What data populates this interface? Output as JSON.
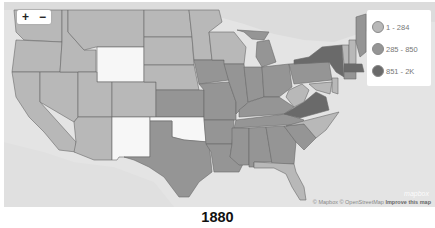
{
  "map": {
    "title": "1880",
    "zoom_in_label": "+",
    "zoom_out_label": "−",
    "legend": [
      {
        "label": "1 - 284",
        "color": "#b8b8b8"
      },
      {
        "label": "285 - 850",
        "color": "#959595"
      },
      {
        "label": "851 - 2K",
        "color": "#6a6a6a"
      }
    ],
    "no_data_color": "#f7f7f7",
    "water_color": "#e4e4e4",
    "attribution": {
      "mapbox": "© Mapbox",
      "osm": "© OpenStreetMap",
      "improve": "Improve this map"
    },
    "logo": "mapbox",
    "states": [
      {
        "name": "Washington",
        "bin": "1 - 284"
      },
      {
        "name": "Oregon",
        "bin": "1 - 284"
      },
      {
        "name": "California",
        "bin": "1 - 284"
      },
      {
        "name": "Nevada",
        "bin": "1 - 284"
      },
      {
        "name": "Idaho",
        "bin": "1 - 284"
      },
      {
        "name": "Montana",
        "bin": "1 - 284"
      },
      {
        "name": "Wyoming",
        "bin": "none"
      },
      {
        "name": "Utah",
        "bin": "1 - 284"
      },
      {
        "name": "Arizona",
        "bin": "1 - 284"
      },
      {
        "name": "Colorado",
        "bin": "1 - 284"
      },
      {
        "name": "New Mexico",
        "bin": "none"
      },
      {
        "name": "North Dakota",
        "bin": "1 - 284"
      },
      {
        "name": "South Dakota",
        "bin": "1 - 284"
      },
      {
        "name": "Nebraska",
        "bin": "1 - 284"
      },
      {
        "name": "Kansas",
        "bin": "285 - 850"
      },
      {
        "name": "Oklahoma",
        "bin": "none"
      },
      {
        "name": "Texas",
        "bin": "285 - 850"
      },
      {
        "name": "Minnesota",
        "bin": "1 - 284"
      },
      {
        "name": "Iowa",
        "bin": "285 - 850"
      },
      {
        "name": "Missouri",
        "bin": "285 - 850"
      },
      {
        "name": "Arkansas",
        "bin": "285 - 850"
      },
      {
        "name": "Louisiana",
        "bin": "285 - 850"
      },
      {
        "name": "Wisconsin",
        "bin": "1 - 284"
      },
      {
        "name": "Illinois",
        "bin": "285 - 850"
      },
      {
        "name": "Michigan",
        "bin": "285 - 850"
      },
      {
        "name": "Indiana",
        "bin": "285 - 850"
      },
      {
        "name": "Ohio",
        "bin": "285 - 850"
      },
      {
        "name": "Kentucky",
        "bin": "285 - 850"
      },
      {
        "name": "Tennessee",
        "bin": "285 - 850"
      },
      {
        "name": "Mississippi",
        "bin": "285 - 850"
      },
      {
        "name": "Alabama",
        "bin": "285 - 850"
      },
      {
        "name": "Georgia",
        "bin": "285 - 850"
      },
      {
        "name": "Florida",
        "bin": "1 - 284"
      },
      {
        "name": "South Carolina",
        "bin": "285 - 850"
      },
      {
        "name": "North Carolina",
        "bin": "1 - 284"
      },
      {
        "name": "Virginia",
        "bin": "851 - 2K"
      },
      {
        "name": "West Virginia",
        "bin": "1 - 284"
      },
      {
        "name": "Pennsylvania",
        "bin": "285 - 850"
      },
      {
        "name": "New York",
        "bin": "851 - 2K"
      },
      {
        "name": "Vermont",
        "bin": "1 - 284"
      },
      {
        "name": "New Hampshire",
        "bin": "1 - 284"
      },
      {
        "name": "Maine",
        "bin": "285 - 850"
      },
      {
        "name": "Massachusetts",
        "bin": "851 - 2K"
      },
      {
        "name": "Connecticut",
        "bin": "285 - 850"
      },
      {
        "name": "New Jersey",
        "bin": "1 - 284"
      },
      {
        "name": "Maryland",
        "bin": "1 - 284"
      }
    ]
  }
}
